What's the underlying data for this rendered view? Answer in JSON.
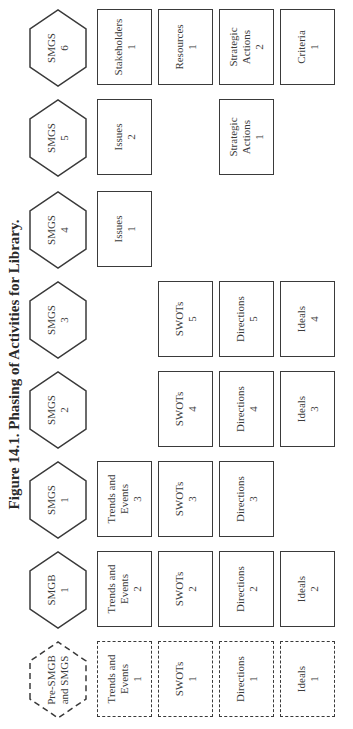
{
  "title": "Figure 14.1. Phasing of Activities for Library.",
  "columns": [
    {
      "hex": [
        "Pre-SMGB",
        "and SMGS"
      ],
      "dashed": true,
      "boxes": {
        "r1": [
          "Trends and",
          "Events",
          "1"
        ],
        "r2": [
          "SWOTs",
          "1"
        ],
        "r3": [
          "Directions",
          "1"
        ],
        "r4": [
          "Ideals",
          "1"
        ]
      }
    },
    {
      "hex": [
        "SMGB",
        "1"
      ],
      "boxes": {
        "r1": [
          "Trends and",
          "Events",
          "2"
        ],
        "r2": [
          "SWOTs",
          "2"
        ],
        "r3": [
          "Directions",
          "2"
        ],
        "r4": [
          "Ideals",
          "2"
        ]
      }
    },
    {
      "hex": [
        "SMGS",
        "1"
      ],
      "boxes": {
        "r1": [
          "Trends and",
          "Events",
          "3"
        ],
        "r2": [
          "SWOTs",
          "3"
        ],
        "r3": [
          "Directions",
          "3"
        ]
      }
    },
    {
      "hex": [
        "SMGS",
        "2"
      ],
      "boxes": {
        "r2": [
          "SWOTs",
          "4"
        ],
        "r3": [
          "Directions",
          "4"
        ],
        "r4": [
          "Ideals",
          "3"
        ]
      }
    },
    {
      "hex": [
        "SMGS",
        "3"
      ],
      "boxes": {
        "r2": [
          "SWOTs",
          "5"
        ],
        "r3": [
          "Directions",
          "5"
        ],
        "r4": [
          "Ideals",
          "4"
        ]
      }
    },
    {
      "hex": [
        "SMGS",
        "4"
      ],
      "boxes": {
        "r1": [
          "Issues",
          "1"
        ]
      }
    },
    {
      "hex": [
        "SMGS",
        "5"
      ],
      "boxes": {
        "r1": [
          "Issues",
          "2"
        ],
        "r3": [
          "Strategic",
          "Actions",
          "1"
        ]
      }
    },
    {
      "hex": [
        "SMGS",
        "6"
      ],
      "boxes": {
        "r1": [
          "Stakeholders",
          "1"
        ],
        "r2": [
          "Resources",
          "1"
        ],
        "r3": [
          "Strategic",
          "Actions",
          "2"
        ],
        "r4": [
          "Criteria",
          "1"
        ]
      }
    }
  ]
}
